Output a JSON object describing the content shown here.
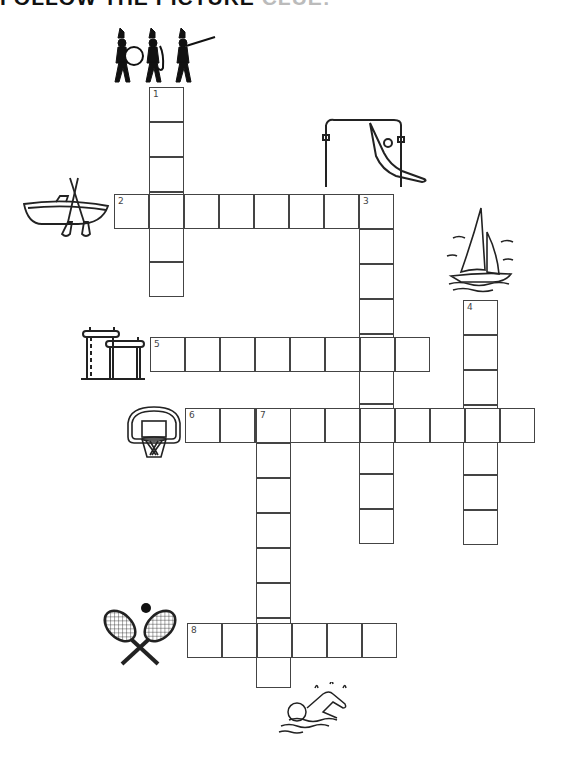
{
  "title": {
    "main": "FOLLOW THE PICTURE ",
    "faded": "CLUE:"
  },
  "cell_size": 35,
  "words": [
    {
      "number": "1",
      "direction": "down",
      "x": 149,
      "y": 87,
      "length": 6,
      "clue_icon": "marching-band-icon"
    },
    {
      "number": "2",
      "direction": "across",
      "x": 114,
      "y": 194,
      "length": 8,
      "clue_icon": "rowboat-icon"
    },
    {
      "number": "3",
      "direction": "down",
      "x": 359,
      "y": 194,
      "length": 10,
      "clue_icon": "gymnast-high-bar-icon"
    },
    {
      "number": "4",
      "direction": "down",
      "x": 463,
      "y": 300,
      "length": 7,
      "clue_icon": "sailboat-icon"
    },
    {
      "number": "5",
      "direction": "across",
      "x": 150,
      "y": 337,
      "length": 8,
      "clue_icon": "parallel-bars-icon"
    },
    {
      "number": "6",
      "direction": "across",
      "x": 185,
      "y": 408,
      "length": 10,
      "clue_icon": "basketball-hoop-icon"
    },
    {
      "number": "7",
      "direction": "down",
      "x": 256,
      "y": 408,
      "length": 8,
      "clue_icon": "swimmer-icon"
    },
    {
      "number": "8",
      "direction": "across",
      "x": 187,
      "y": 623,
      "length": 6,
      "clue_icon": "tennis-rackets-icon"
    }
  ]
}
